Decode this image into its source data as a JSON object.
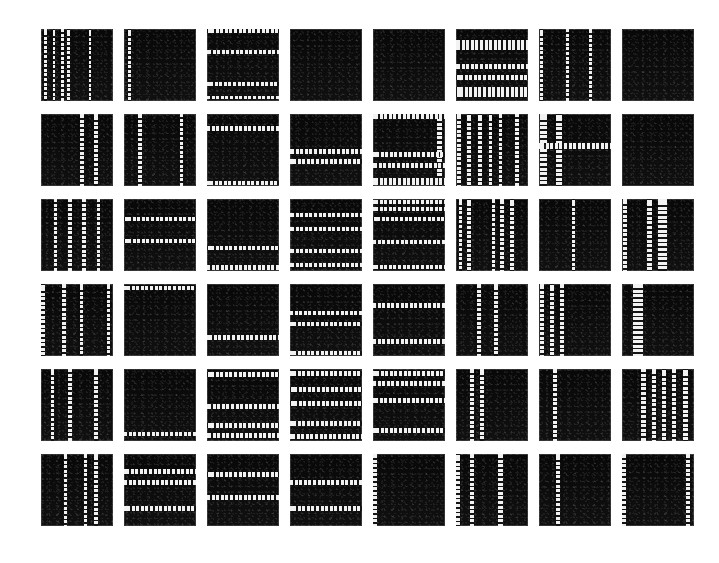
{
  "figure": {
    "title": "",
    "background_color": "#ffffff",
    "patch_color": "#0c0c0c",
    "stripe_color": "#f2f2f2",
    "border_color": "#8c8c8c",
    "rows": 6,
    "columns": 8,
    "tile_count": 48,
    "tile_size_px": 72,
    "column_gap_px": 11,
    "row_gap_px": 13,
    "origin_x_px": 41,
    "origin_y_px": 29
  },
  "chart_data": {
    "type": "heatmap",
    "title": "",
    "xlabel": "",
    "ylabel": "",
    "categories": [
      "col-1",
      "col-2",
      "col-3",
      "col-4",
      "col-5",
      "col-6",
      "col-7",
      "col-8"
    ],
    "row_labels": [
      "row-1",
      "row-2",
      "row-3",
      "row-4",
      "row-5",
      "row-6"
    ],
    "legend": [],
    "grid": false,
    "tiles": [
      {
        "id": "r1c1",
        "row": 1,
        "col": 1,
        "orientation": "vertical",
        "stripe_count": 5,
        "v": [
          {
            "p": 6,
            "w": 4
          },
          {
            "p": 18,
            "w": 4
          },
          {
            "p": 30,
            "w": 4
          },
          {
            "p": 38,
            "w": 5
          },
          {
            "p": 68,
            "w": 4
          }
        ],
        "h": []
      },
      {
        "id": "r1c2",
        "row": 1,
        "col": 2,
        "orientation": "vertical",
        "stripe_count": 1,
        "v": [
          {
            "p": 8,
            "w": 4
          }
        ],
        "h": []
      },
      {
        "id": "r1c3",
        "row": 1,
        "col": 3,
        "orientation": "horizontal",
        "stripe_count": 4,
        "v": [],
        "h": [
          {
            "p": 3,
            "w": 5
          },
          {
            "p": 32,
            "w": 5
          },
          {
            "p": 76,
            "w": 5
          },
          {
            "p": 95,
            "w": 5
          }
        ]
      },
      {
        "id": "r1c4",
        "row": 1,
        "col": 4,
        "orientation": "none",
        "stripe_count": 0,
        "v": [],
        "h": []
      },
      {
        "id": "r1c5",
        "row": 1,
        "col": 5,
        "orientation": "none",
        "stripe_count": 0,
        "v": [],
        "h": []
      },
      {
        "id": "r1c6",
        "row": 1,
        "col": 6,
        "orientation": "horizontal",
        "stripe_count": 4,
        "v": [],
        "h": [
          {
            "p": 22,
            "w": 14
          },
          {
            "p": 52,
            "w": 7
          },
          {
            "p": 68,
            "w": 7
          },
          {
            "p": 88,
            "w": 14
          }
        ]
      },
      {
        "id": "r1c7",
        "row": 1,
        "col": 7,
        "orientation": "vertical",
        "stripe_count": 3,
        "v": [
          {
            "p": 3,
            "w": 4
          },
          {
            "p": 40,
            "w": 4
          },
          {
            "p": 72,
            "w": 4
          }
        ],
        "h": []
      },
      {
        "id": "r1c8",
        "row": 1,
        "col": 8,
        "orientation": "none",
        "stripe_count": 0,
        "v": [],
        "h": []
      },
      {
        "id": "r2c1",
        "row": 2,
        "col": 1,
        "orientation": "vertical",
        "stripe_count": 2,
        "v": [
          {
            "p": 57,
            "w": 5
          },
          {
            "p": 76,
            "w": 5
          }
        ],
        "h": []
      },
      {
        "id": "r2c2",
        "row": 2,
        "col": 2,
        "orientation": "vertical",
        "stripe_count": 2,
        "v": [
          {
            "p": 22,
            "w": 5
          },
          {
            "p": 80,
            "w": 5
          }
        ],
        "h": []
      },
      {
        "id": "r2c3",
        "row": 2,
        "col": 3,
        "orientation": "horizontal",
        "stripe_count": 2,
        "v": [],
        "h": [
          {
            "p": 20,
            "w": 6
          },
          {
            "p": 96,
            "w": 6
          }
        ]
      },
      {
        "id": "r2c4",
        "row": 2,
        "col": 4,
        "orientation": "horizontal",
        "stripe_count": 2,
        "v": [],
        "h": [
          {
            "p": 52,
            "w": 6
          },
          {
            "p": 66,
            "w": 6
          }
        ]
      },
      {
        "id": "r2c5",
        "row": 2,
        "col": 5,
        "orientation": "mixed",
        "stripe_count": 5,
        "v": [
          {
            "p": 93,
            "w": 7
          }
        ],
        "h": [
          {
            "p": 4,
            "w": 7
          },
          {
            "p": 56,
            "w": 7
          },
          {
            "p": 72,
            "w": 7
          },
          {
            "p": 94,
            "w": 10
          }
        ]
      },
      {
        "id": "r2c6",
        "row": 2,
        "col": 6,
        "orientation": "vertical",
        "stripe_count": 6,
        "v": [
          {
            "p": 4,
            "w": 6
          },
          {
            "p": 18,
            "w": 6
          },
          {
            "p": 33,
            "w": 6
          },
          {
            "p": 48,
            "w": 5
          },
          {
            "p": 62,
            "w": 5
          },
          {
            "p": 85,
            "w": 6
          }
        ],
        "h": []
      },
      {
        "id": "r2c7",
        "row": 2,
        "col": 7,
        "orientation": "cross",
        "stripe_count": 4,
        "v": [
          {
            "p": 6,
            "w": 9
          },
          {
            "p": 28,
            "w": 9
          }
        ],
        "h": [
          {
            "p": 44,
            "w": 8
          }
        ]
      },
      {
        "id": "r2c8",
        "row": 2,
        "col": 8,
        "orientation": "none",
        "stripe_count": 0,
        "v": [],
        "h": []
      },
      {
        "id": "r3c1",
        "row": 3,
        "col": 1,
        "orientation": "vertical",
        "stripe_count": 4,
        "v": [
          {
            "p": 20,
            "w": 5
          },
          {
            "p": 40,
            "w": 5
          },
          {
            "p": 60,
            "w": 5
          },
          {
            "p": 80,
            "w": 5
          }
        ],
        "h": []
      },
      {
        "id": "r3c2",
        "row": 3,
        "col": 2,
        "orientation": "horizontal",
        "stripe_count": 2,
        "v": [],
        "h": [
          {
            "p": 28,
            "w": 6
          },
          {
            "p": 58,
            "w": 6
          }
        ]
      },
      {
        "id": "r3c3",
        "row": 3,
        "col": 3,
        "orientation": "horizontal",
        "stripe_count": 2,
        "v": [],
        "h": [
          {
            "p": 68,
            "w": 6
          },
          {
            "p": 95,
            "w": 6
          }
        ]
      },
      {
        "id": "r3c4",
        "row": 3,
        "col": 4,
        "orientation": "horizontal",
        "stripe_count": 4,
        "v": [],
        "h": [
          {
            "p": 22,
            "w": 6
          },
          {
            "p": 42,
            "w": 6
          },
          {
            "p": 72,
            "w": 6
          },
          {
            "p": 92,
            "w": 6
          }
        ]
      },
      {
        "id": "r3c5",
        "row": 3,
        "col": 5,
        "orientation": "horizontal",
        "stripe_count": 5,
        "v": [],
        "h": [
          {
            "p": 4,
            "w": 6
          },
          {
            "p": 14,
            "w": 6
          },
          {
            "p": 28,
            "w": 6
          },
          {
            "p": 60,
            "w": 6
          },
          {
            "p": 94,
            "w": 6
          }
        ]
      },
      {
        "id": "r3c6",
        "row": 3,
        "col": 6,
        "orientation": "vertical",
        "stripe_count": 5,
        "v": [
          {
            "p": 6,
            "w": 5
          },
          {
            "p": 18,
            "w": 5
          },
          {
            "p": 52,
            "w": 5
          },
          {
            "p": 64,
            "w": 5
          },
          {
            "p": 78,
            "w": 5
          }
        ],
        "h": []
      },
      {
        "id": "r3c7",
        "row": 3,
        "col": 7,
        "orientation": "vertical",
        "stripe_count": 1,
        "v": [
          {
            "p": 48,
            "w": 5
          }
        ],
        "h": []
      },
      {
        "id": "r3c8",
        "row": 3,
        "col": 8,
        "orientation": "vertical",
        "stripe_count": 3,
        "v": [
          {
            "p": 4,
            "w": 6
          },
          {
            "p": 38,
            "w": 6
          },
          {
            "p": 56,
            "w": 12
          }
        ],
        "h": []
      },
      {
        "id": "r4c1",
        "row": 4,
        "col": 1,
        "orientation": "vertical",
        "stripe_count": 4,
        "v": [
          {
            "p": 3,
            "w": 5
          },
          {
            "p": 32,
            "w": 5
          },
          {
            "p": 56,
            "w": 5
          },
          {
            "p": 94,
            "w": 5
          }
        ],
        "h": []
      },
      {
        "id": "r4c2",
        "row": 4,
        "col": 2,
        "orientation": "horizontal",
        "stripe_count": 1,
        "v": [],
        "h": [
          {
            "p": 6,
            "w": 6
          }
        ]
      },
      {
        "id": "r4c3",
        "row": 4,
        "col": 3,
        "orientation": "horizontal",
        "stripe_count": 1,
        "v": [],
        "h": [
          {
            "p": 74,
            "w": 7
          }
        ]
      },
      {
        "id": "r4c4",
        "row": 4,
        "col": 4,
        "orientation": "horizontal",
        "stripe_count": 3,
        "v": [],
        "h": [
          {
            "p": 40,
            "w": 6
          },
          {
            "p": 56,
            "w": 6
          },
          {
            "p": 96,
            "w": 6
          }
        ]
      },
      {
        "id": "r4c5",
        "row": 4,
        "col": 5,
        "orientation": "horizontal",
        "stripe_count": 2,
        "v": [],
        "h": [
          {
            "p": 30,
            "w": 6
          },
          {
            "p": 80,
            "w": 6
          }
        ]
      },
      {
        "id": "r4c6",
        "row": 4,
        "col": 6,
        "orientation": "vertical",
        "stripe_count": 2,
        "v": [
          {
            "p": 32,
            "w": 6
          },
          {
            "p": 56,
            "w": 6
          }
        ],
        "h": []
      },
      {
        "id": "r4c7",
        "row": 4,
        "col": 7,
        "orientation": "vertical",
        "stripe_count": 3,
        "v": [
          {
            "p": 4,
            "w": 6
          },
          {
            "p": 18,
            "w": 6
          },
          {
            "p": 32,
            "w": 6
          }
        ],
        "h": []
      },
      {
        "id": "r4c8",
        "row": 4,
        "col": 8,
        "orientation": "vertical",
        "stripe_count": 1,
        "v": [
          {
            "p": 22,
            "w": 14
          }
        ],
        "h": []
      },
      {
        "id": "r5c1",
        "row": 5,
        "col": 1,
        "orientation": "vertical",
        "stripe_count": 3,
        "v": [
          {
            "p": 16,
            "w": 5
          },
          {
            "p": 40,
            "w": 5
          },
          {
            "p": 76,
            "w": 5
          }
        ],
        "h": []
      },
      {
        "id": "r5c2",
        "row": 5,
        "col": 2,
        "orientation": "horizontal",
        "stripe_count": 1,
        "v": [],
        "h": [
          {
            "p": 90,
            "w": 6
          }
        ]
      },
      {
        "id": "r5c3",
        "row": 5,
        "col": 3,
        "orientation": "horizontal",
        "stripe_count": 4,
        "v": [],
        "h": [
          {
            "p": 8,
            "w": 7
          },
          {
            "p": 52,
            "w": 7
          },
          {
            "p": 78,
            "w": 7
          },
          {
            "p": 92,
            "w": 7
          }
        ]
      },
      {
        "id": "r5c4",
        "row": 5,
        "col": 4,
        "orientation": "horizontal",
        "stripe_count": 5,
        "v": [],
        "h": [
          {
            "p": 6,
            "w": 7
          },
          {
            "p": 28,
            "w": 7
          },
          {
            "p": 48,
            "w": 7
          },
          {
            "p": 76,
            "w": 7
          },
          {
            "p": 94,
            "w": 7
          }
        ]
      },
      {
        "id": "r5c5",
        "row": 5,
        "col": 5,
        "orientation": "horizontal",
        "stripe_count": 4,
        "v": [],
        "h": [
          {
            "p": 6,
            "w": 7
          },
          {
            "p": 20,
            "w": 7
          },
          {
            "p": 44,
            "w": 7
          },
          {
            "p": 86,
            "w": 7
          }
        ]
      },
      {
        "id": "r5c6",
        "row": 5,
        "col": 6,
        "orientation": "vertical",
        "stripe_count": 2,
        "v": [
          {
            "p": 22,
            "w": 5
          },
          {
            "p": 36,
            "w": 5
          }
        ],
        "h": []
      },
      {
        "id": "r5c7",
        "row": 5,
        "col": 7,
        "orientation": "vertical",
        "stripe_count": 1,
        "v": [
          {
            "p": 22,
            "w": 5
          }
        ],
        "h": []
      },
      {
        "id": "r5c8",
        "row": 5,
        "col": 8,
        "orientation": "vertical",
        "stripe_count": 5,
        "v": [
          {
            "p": 30,
            "w": 6
          },
          {
            "p": 44,
            "w": 6
          },
          {
            "p": 58,
            "w": 6
          },
          {
            "p": 72,
            "w": 6
          },
          {
            "p": 88,
            "w": 6
          }
        ],
        "h": []
      },
      {
        "id": "r6c1",
        "row": 6,
        "col": 1,
        "orientation": "vertical",
        "stripe_count": 3,
        "v": [
          {
            "p": 34,
            "w": 5
          },
          {
            "p": 62,
            "w": 5
          },
          {
            "p": 76,
            "w": 5
          }
        ],
        "h": []
      },
      {
        "id": "r6c2",
        "row": 6,
        "col": 2,
        "orientation": "horizontal",
        "stripe_count": 3,
        "v": [],
        "h": [
          {
            "p": 24,
            "w": 7
          },
          {
            "p": 40,
            "w": 7
          },
          {
            "p": 76,
            "w": 7
          }
        ]
      },
      {
        "id": "r6c3",
        "row": 6,
        "col": 3,
        "orientation": "horizontal",
        "stripe_count": 2,
        "v": [],
        "h": [
          {
            "p": 28,
            "w": 7
          },
          {
            "p": 60,
            "w": 7
          }
        ]
      },
      {
        "id": "r6c4",
        "row": 6,
        "col": 4,
        "orientation": "horizontal",
        "stripe_count": 2,
        "v": [],
        "h": [
          {
            "p": 40,
            "w": 7
          },
          {
            "p": 76,
            "w": 7
          }
        ]
      },
      {
        "id": "r6c5",
        "row": 6,
        "col": 5,
        "orientation": "vertical",
        "stripe_count": 1,
        "v": [
          {
            "p": 2,
            "w": 5
          }
        ],
        "h": []
      },
      {
        "id": "r6c6",
        "row": 6,
        "col": 6,
        "orientation": "vertical",
        "stripe_count": 3,
        "v": [
          {
            "p": 3,
            "w": 6
          },
          {
            "p": 22,
            "w": 6
          },
          {
            "p": 62,
            "w": 6
          }
        ],
        "h": []
      },
      {
        "id": "r6c7",
        "row": 6,
        "col": 7,
        "orientation": "vertical",
        "stripe_count": 1,
        "v": [
          {
            "p": 26,
            "w": 6
          }
        ],
        "h": []
      },
      {
        "id": "r6c8",
        "row": 6,
        "col": 8,
        "orientation": "vertical",
        "stripe_count": 2,
        "v": [
          {
            "p": 2,
            "w": 6
          },
          {
            "p": 92,
            "w": 6
          }
        ],
        "h": []
      }
    ]
  }
}
